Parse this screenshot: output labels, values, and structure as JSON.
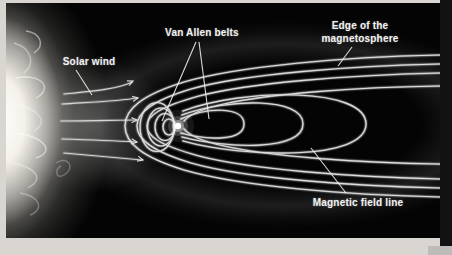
{
  "figure": {
    "title_semantic": "Earth magnetosphere diagram",
    "labels": {
      "solar_wind": "Solar wind",
      "van_allen_belts": "Van Allen belts",
      "edge_of_magnetosphere": {
        "line1": "Edge of the",
        "line2": "magnetosphere"
      },
      "magnetic_field_line": "Magnetic field line"
    },
    "elements": {
      "sun": "sun at left edge",
      "earth": "bright dot at center of field lines",
      "solar_wind_arrows": 5,
      "field_lines": "nested closed loops around Earth stretching into a tail to the right",
      "van_allen_leader_lines": 2
    },
    "colors": {
      "page_background": "#d9d6d1",
      "figure_background": "#040404",
      "field_line": "#e6e6e6",
      "text": "#f2f2f2",
      "right_strip": "#121212"
    }
  }
}
